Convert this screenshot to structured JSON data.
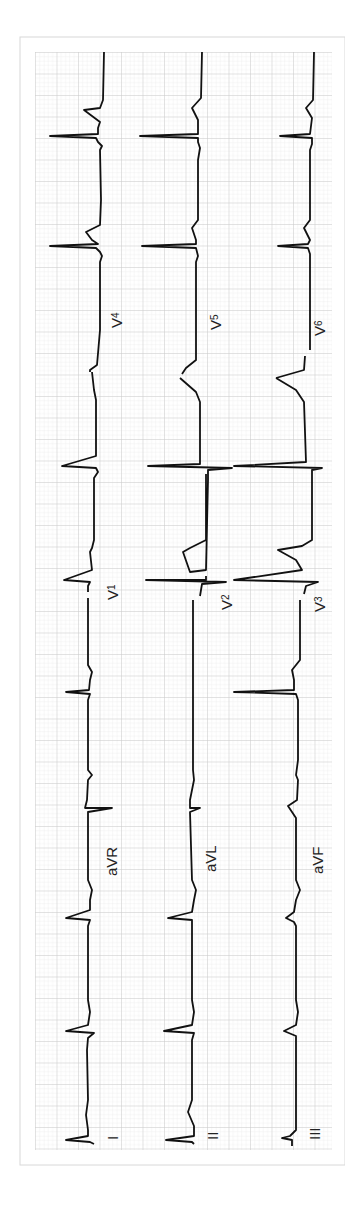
{
  "leads": {
    "col1": [
      "I",
      "aVR",
      "V1",
      "V4"
    ],
    "col2": [
      "II",
      "aVL",
      "V2",
      "V5"
    ],
    "col3": [
      "III",
      "aVF",
      "V3",
      "V6"
    ]
  },
  "labels": {
    "I": "I",
    "II": "II",
    "III": "III",
    "aVR": "aVR",
    "aVL": "aVL",
    "aVF": "aVF",
    "V1": "V",
    "V1_sub": "1",
    "V2": "V",
    "V2_sub": "2",
    "V3": "V",
    "V3_sub": "3",
    "V4": "V",
    "V4_sub": "4",
    "V5": "V",
    "V5_sub": "5",
    "V6": "V",
    "V6_sub": "6"
  },
  "colors": {
    "paper": "#ffffff",
    "grid_minor": "#e4e4e4",
    "grid_major": "#c8c8c8",
    "trace": "#111111",
    "frame": "#d8d8d8"
  }
}
